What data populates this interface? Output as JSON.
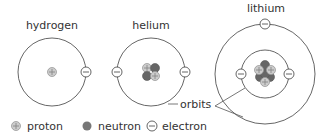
{
  "atoms": [
    {
      "name": "hydrogen",
      "protons": 1,
      "neutrons": 0,
      "electrons": 1
    },
    {
      "name": "helium",
      "protons": 2,
      "neutrons": 2,
      "electrons": 2
    },
    {
      "name": "lithium",
      "protons": 3,
      "neutrons": 4,
      "electrons": 3
    }
  ],
  "annotation": {
    "orbits_label": "orbits"
  },
  "legend": {
    "proton": "proton",
    "neutron": "neutron",
    "electron": "electron"
  },
  "colors": {
    "orbit": "#555555",
    "proton_fill": "#cccccc",
    "neutron_fill": "#666666",
    "electron_fill": "#ffffff",
    "text": "#333333"
  }
}
